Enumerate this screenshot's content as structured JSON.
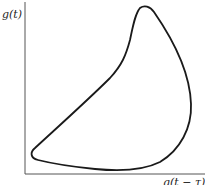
{
  "diagram": {
    "ylabel": "g(t)",
    "xlabel": "g(t − τ)",
    "type": "phase-portrait",
    "colors": {
      "curve": "#1a1a1a",
      "axis": "#555555"
    }
  }
}
